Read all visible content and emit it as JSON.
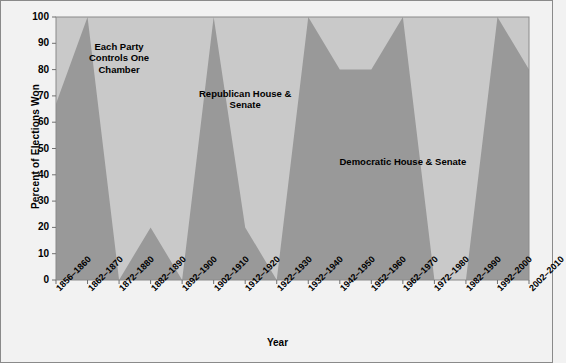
{
  "figure": {
    "background": "#f2f2f2",
    "plot_background": "#c9c9c9",
    "series_color": "#999999",
    "frame_color": "#8a8a8a"
  },
  "chart_data": {
    "type": "area",
    "title": "",
    "xlabel": "Year",
    "ylabel": "Percent of Elections Won",
    "ylim": [
      0,
      100
    ],
    "yticks": [
      0,
      10,
      20,
      30,
      40,
      50,
      60,
      70,
      80,
      90,
      100
    ],
    "grid": false,
    "legend_position": "none",
    "categories": [
      "1856–1860",
      "1862–1870",
      "1872–1880",
      "1882–1890",
      "1892–1900",
      "1902–1910",
      "1912–1920",
      "1922–1930",
      "1932–1940",
      "1942–1950",
      "1952–1960",
      "1962–1970",
      "1972–1980",
      "1982–1990",
      "1992–2000",
      "2002–2010"
    ],
    "series": [
      {
        "name": "Republican House & Senate",
        "color": "#999999",
        "values": [
          67,
          100,
          0,
          20,
          0,
          100,
          20,
          0,
          100,
          80,
          80,
          100,
          0,
          0,
          100,
          80
        ]
      },
      {
        "name": "Democratic House & Senate / Each Party Controls One Chamber",
        "color": "#c9c9c9",
        "values": [
          33,
          0,
          100,
          80,
          100,
          0,
          80,
          100,
          0,
          20,
          20,
          0,
          100,
          100,
          0,
          20
        ]
      }
    ],
    "annotations": [
      {
        "text": "Each Party\nControls One\nChamber",
        "x_category": "1872–1880",
        "y": 88
      },
      {
        "text": "Republican House &\nSenate",
        "x_category": "1912–1920",
        "y": 70
      },
      {
        "text": "Democratic House & Senate",
        "x_category": "1962–1970",
        "y": 44
      }
    ]
  }
}
